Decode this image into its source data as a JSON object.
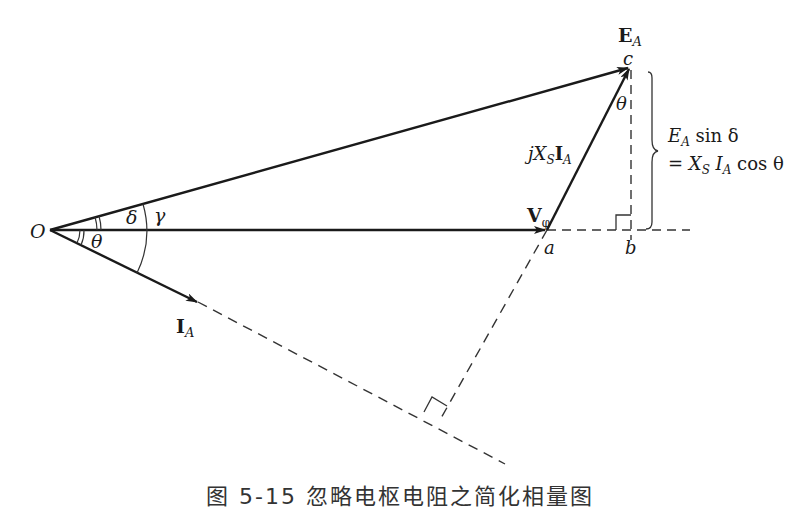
{
  "diagram": {
    "type": "phasor-diagram",
    "points": {
      "O": {
        "label": "O",
        "x": 50,
        "y": 230
      },
      "a": {
        "label": "a",
        "x": 547,
        "y": 230
      },
      "b": {
        "label": "b",
        "x": 631,
        "y": 230
      },
      "c": {
        "label": "c",
        "x": 630,
        "y": 67
      }
    },
    "vectors": [
      {
        "name": "E_A",
        "label_main": "E",
        "label_sub": "A",
        "from": "O",
        "to": "c"
      },
      {
        "name": "V_phi",
        "label_main": "V",
        "label_sub": "φ",
        "from": "O",
        "to": "a"
      },
      {
        "name": "jXsIA",
        "label_prefix": "jX",
        "label_sub1": "S",
        "label_main": "I",
        "label_sub2": "A",
        "from": "a",
        "to": "c"
      },
      {
        "name": "I_A",
        "label_main": "I",
        "label_sub": "A",
        "from": "O",
        "to": "IA_tip"
      }
    ],
    "angles": {
      "delta": "δ",
      "gamma": "γ",
      "theta_origin": "θ",
      "theta_top": "θ"
    },
    "annotation": {
      "line1_main": "E",
      "line1_sub": "A",
      "line1_rest": " sin δ",
      "line2_eq": "= X",
      "line2_sub1": "S",
      "line2_mid": " I",
      "line2_sub2": "A",
      "line2_rest": " cos θ"
    }
  },
  "caption": "图 5-15  忽略电枢电阻之简化相量图"
}
